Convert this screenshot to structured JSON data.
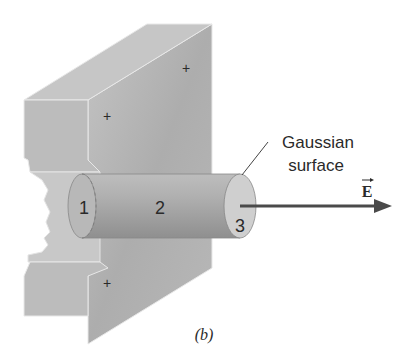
{
  "figure": {
    "caption": "(b)",
    "labels": {
      "end_cap_1": "1",
      "side_2": "2",
      "end_cap_3": "3",
      "gaussian_line1": "Gaussian",
      "gaussian_line2": "surface",
      "field": "E"
    },
    "charges": [
      "+",
      "+",
      "+"
    ],
    "colors": {
      "plate": "#b8b8b8",
      "plate_dark": "#a4a4a4",
      "cylinder": "#a9a9a9",
      "arrow": "#4a4a4a",
      "text": "#2a2a2a"
    }
  }
}
